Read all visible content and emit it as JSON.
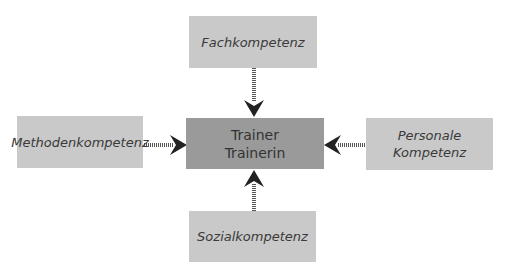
{
  "diagram": {
    "center": {
      "lines": [
        "Trainer",
        "Trainerin"
      ]
    },
    "nodes": {
      "top": {
        "lines": [
          "Fachkompetenz"
        ]
      },
      "left": {
        "lines": [
          "Methodenkompetenz"
        ]
      },
      "right": {
        "lines": [
          "Personale",
          "Kompetenz"
        ]
      },
      "bottom": {
        "lines": [
          "Sozialkompetenz"
        ]
      }
    },
    "edges": [
      {
        "from": "Fachkompetenz",
        "to": "Trainer Trainerin",
        "style": "dotted-arrow"
      },
      {
        "from": "Methodenkompetenz",
        "to": "Trainer Trainerin",
        "style": "dotted-arrow"
      },
      {
        "from": "Personale Kompetenz",
        "to": "Trainer Trainerin",
        "style": "dotted-arrow"
      },
      {
        "from": "Sozialkompetenz",
        "to": "Trainer Trainerin",
        "style": "dotted-arrow"
      }
    ],
    "colors": {
      "outer_box": "#c9c9c9",
      "center_box": "#9a9a9a",
      "arrow": "#222222",
      "text": "#3a3a3a"
    }
  }
}
